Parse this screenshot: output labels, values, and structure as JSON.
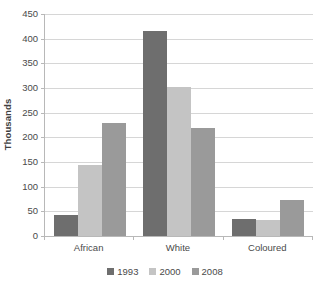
{
  "chart_data": {
    "type": "bar",
    "title": "",
    "xlabel": "",
    "ylabel": "Thousands",
    "categories": [
      "African",
      "White",
      "Coloured"
    ],
    "series": [
      {
        "name": "1993",
        "color": "#6e6e6e",
        "values": [
          42,
          415,
          35
        ]
      },
      {
        "name": "2000",
        "color": "#c4c4c4",
        "values": [
          143,
          303,
          33
        ]
      },
      {
        "name": "2008",
        "color": "#9a9a9a",
        "values": [
          230,
          218,
          73
        ]
      }
    ],
    "ylim": [
      0,
      450
    ],
    "ytick_step": 50,
    "yticks": [
      0,
      50,
      100,
      150,
      200,
      250,
      300,
      350,
      400,
      450
    ],
    "ytick_labels": [
      "0",
      "50",
      "100",
      "150",
      "200",
      "250",
      "300",
      "350",
      "400",
      "450"
    ],
    "grid": true,
    "grid_axis": "y",
    "legend_position": "bottom"
  },
  "colors": {
    "gridline": "#d6d6d6",
    "axis": "#b8b8b8",
    "text": "#4a4a4a",
    "background": "#ffffff"
  }
}
